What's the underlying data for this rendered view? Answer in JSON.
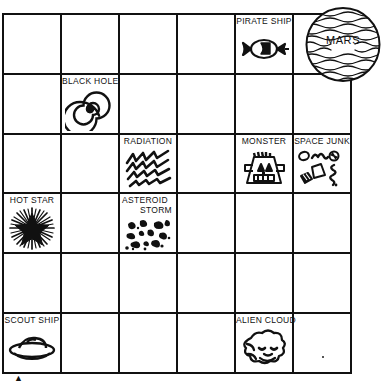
{
  "board": {
    "title": "Space Game Board",
    "columns": 6,
    "rows": 6,
    "cells": [
      {
        "row": 1,
        "col": 5,
        "label": "PIRATE SHIP",
        "icon": "pirate-ship-icon"
      },
      {
        "row": 2,
        "col": 2,
        "label": "BLACK HOLE",
        "icon": "black-hole-icon"
      },
      {
        "row": 3,
        "col": 3,
        "label": "RADIATION",
        "icon": "radiation-icon"
      },
      {
        "row": 3,
        "col": 5,
        "label": "MONSTER",
        "icon": "monster-icon"
      },
      {
        "row": 3,
        "col": 6,
        "label": "SPACE JUNK",
        "icon": "space-junk-icon"
      },
      {
        "row": 4,
        "col": 1,
        "label": "HOT STAR",
        "icon": "hot-star-icon"
      },
      {
        "row": 4,
        "col": 3,
        "label_line1": "ASTEROID",
        "label_line2": "STORM",
        "label": "ASTEROID STORM",
        "icon": "asteroid-storm-icon"
      },
      {
        "row": 6,
        "col": 1,
        "label": "SCOUT SHIP",
        "icon": "scout-ship-icon"
      },
      {
        "row": 6,
        "col": 5,
        "label": "ALIEN CLOUD",
        "icon": "alien-cloud-icon"
      }
    ]
  },
  "planet": {
    "label": "MARS",
    "icon": "planet-mars-icon"
  },
  "marks": {
    "bottom_tick": "▲"
  },
  "colors": {
    "ink": "#111111",
    "paper": "#ffffff"
  }
}
